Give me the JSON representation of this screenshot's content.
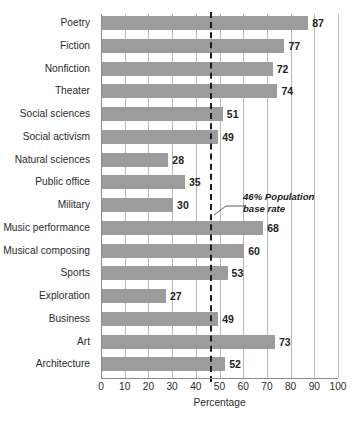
{
  "chart_data": {
    "type": "bar",
    "orientation": "horizontal",
    "title": "",
    "xlabel": "Percentage",
    "ylabel": "",
    "xlim": [
      0,
      100
    ],
    "grid": true,
    "legend": null,
    "categories": [
      "Poetry",
      "Fiction",
      "Nonfiction",
      "Theater",
      "Social sciences",
      "Social activism",
      "Natural sciences",
      "Public office",
      "Military",
      "Music performance",
      "Musical composing",
      "Sports",
      "Exploration",
      "Business",
      "Art",
      "Architecture"
    ],
    "values": [
      87,
      77,
      72,
      74,
      51,
      49,
      28,
      35,
      30,
      68,
      60,
      53,
      27,
      49,
      73,
      52
    ],
    "value_labels": [
      "87",
      "77",
      "72",
      "74",
      "51",
      "49",
      "28",
      "35",
      "30",
      "68",
      "60",
      "53",
      "27",
      "49",
      "73",
      "52"
    ],
    "xticks": [
      0,
      10,
      20,
      30,
      40,
      50,
      60,
      70,
      80,
      90,
      100
    ],
    "xtick_labels": [
      "0",
      "10",
      "20",
      "30",
      "40",
      "50",
      "60",
      "70",
      "80",
      "90",
      "100"
    ],
    "reference_line": {
      "value": 46,
      "style": "dashed",
      "label_line1": "46% Population",
      "label_line2": "base rate"
    },
    "colors": {
      "bar": "#9c9c9c",
      "gridline": "#b9b9b9",
      "axis": "#8c8c8c",
      "reference_line": "#1c1c1c",
      "text": "#2b2b2b",
      "background": "#ffffff"
    }
  },
  "footer": {
    "note": ""
  }
}
